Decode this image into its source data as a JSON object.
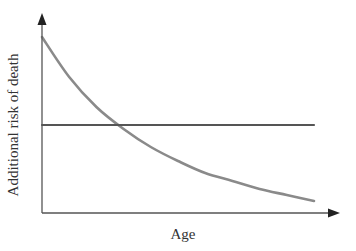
{
  "chart_data": {
    "type": "line",
    "title": "",
    "xlabel": "Age",
    "ylabel": "Additional risk of death",
    "grid": false,
    "legend": null,
    "axis_ticks": "none",
    "x": [
      0,
      0.1,
      0.2,
      0.3,
      0.4,
      0.5,
      0.6,
      0.7,
      0.8,
      0.9,
      1.0
    ],
    "series": [
      {
        "name": "decreasing risk curve",
        "color": "#8a8a8a",
        "values": [
          0.88,
          0.68,
          0.53,
          0.42,
          0.33,
          0.26,
          0.2,
          0.16,
          0.12,
          0.09,
          0.06
        ]
      },
      {
        "name": "constant risk line",
        "color": "#555555",
        "values": [
          0.44,
          0.44,
          0.44,
          0.44,
          0.44,
          0.44,
          0.44,
          0.44,
          0.44,
          0.44,
          0.44
        ]
      }
    ],
    "xlim": [
      0,
      1.1
    ],
    "ylim": [
      0,
      1
    ]
  }
}
